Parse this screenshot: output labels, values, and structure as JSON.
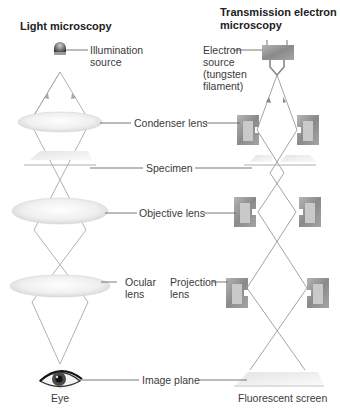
{
  "titles": {
    "light": "Light microscopy",
    "tem": "Transmission electron\nmicroscopy"
  },
  "labels": {
    "illumination_source": "Illumination\nsource",
    "electron_source": "Electron\nsource\n(tungsten\nfilament)",
    "condenser_lens": "Condenser lens",
    "specimen": "Specimen",
    "objective_lens": "Objective lens",
    "ocular_lens": "Ocular\nlens",
    "projection_lens": "Projection\nlens",
    "image_plane": "Image plane",
    "eye": "Eye",
    "fluorescent_screen": "Fluorescent screen"
  },
  "colors": {
    "ray": "#a8a8a8",
    "leader": "#555555",
    "magnet_outer": "#8f8f8f",
    "magnet_inner": "#c9c9c9",
    "glass": "#eeeeee"
  }
}
